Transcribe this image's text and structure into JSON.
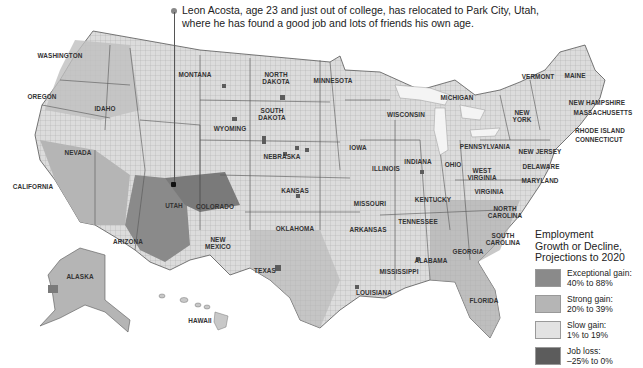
{
  "caption": {
    "line1": "Leon Acosta, age 23 and just out of college, has relocated to Park City, Utah,",
    "line2": "where he has found a good job and lots of friends his own age."
  },
  "map": {
    "title": "Employment Growth or Decline, Projections to 2020",
    "colors": {
      "exceptional": "#8a8a8a",
      "strong": "#b5b5b5",
      "slow": "#e2e2e2",
      "loss": "#5c5c5c",
      "border": "#444444",
      "water": "#ffffff"
    },
    "state_labels": [
      {
        "name": "WASHINGTON",
        "x": 60,
        "y": 55
      },
      {
        "name": "OREGON",
        "x": 42,
        "y": 96
      },
      {
        "name": "IDAHO",
        "x": 105,
        "y": 108
      },
      {
        "name": "MONTANA",
        "x": 195,
        "y": 74
      },
      {
        "name": "WYOMING",
        "x": 230,
        "y": 128
      },
      {
        "name": "NEVADA",
        "x": 78,
        "y": 152
      },
      {
        "name": "CALIFORNIA",
        "x": 33,
        "y": 186
      },
      {
        "name": "UTAH",
        "x": 174,
        "y": 205
      },
      {
        "name": "COLORADO",
        "x": 215,
        "y": 206
      },
      {
        "name": "ARIZONA",
        "x": 128,
        "y": 241
      },
      {
        "name": "NEW MEXICO",
        "x": 218,
        "y": 243
      },
      {
        "name": "NORTH DAKOTA",
        "x": 276,
        "y": 78
      },
      {
        "name": "SOUTH DAKOTA",
        "x": 272,
        "y": 114
      },
      {
        "name": "NEBRASKA",
        "x": 282,
        "y": 156
      },
      {
        "name": "KANSAS",
        "x": 295,
        "y": 190
      },
      {
        "name": "OKLAHOMA",
        "x": 295,
        "y": 228
      },
      {
        "name": "TEXAS",
        "x": 265,
        "y": 270
      },
      {
        "name": "MINNESOTA",
        "x": 333,
        "y": 80
      },
      {
        "name": "IOWA",
        "x": 358,
        "y": 147
      },
      {
        "name": "MISSOURI",
        "x": 370,
        "y": 203
      },
      {
        "name": "ARKANSAS",
        "x": 368,
        "y": 229
      },
      {
        "name": "LOUISIANA",
        "x": 374,
        "y": 292
      },
      {
        "name": "WISCONSIN",
        "x": 406,
        "y": 114
      },
      {
        "name": "ILLINOIS",
        "x": 386,
        "y": 168
      },
      {
        "name": "MICHIGAN",
        "x": 457,
        "y": 97
      },
      {
        "name": "INDIANA",
        "x": 418,
        "y": 161
      },
      {
        "name": "OHIO",
        "x": 453,
        "y": 164
      },
      {
        "name": "KENTUCKY",
        "x": 433,
        "y": 199
      },
      {
        "name": "TENNESSEE",
        "x": 418,
        "y": 221
      },
      {
        "name": "MISSISSIPPI",
        "x": 399,
        "y": 271
      },
      {
        "name": "ALABAMA",
        "x": 431,
        "y": 260
      },
      {
        "name": "GEORGIA",
        "x": 468,
        "y": 251
      },
      {
        "name": "FLORIDA",
        "x": 484,
        "y": 300
      },
      {
        "name": "SOUTH CAROLINA",
        "x": 503,
        "y": 239
      },
      {
        "name": "NORTH CAROLINA",
        "x": 505,
        "y": 212
      },
      {
        "name": "VIRGINIA",
        "x": 489,
        "y": 191
      },
      {
        "name": "WEST VIRGINIA",
        "x": 482,
        "y": 174
      },
      {
        "name": "PENNSYLVANIA",
        "x": 485,
        "y": 146
      },
      {
        "name": "NEW YORK",
        "x": 522,
        "y": 116
      },
      {
        "name": "NEW JERSEY",
        "x": 540,
        "y": 151
      },
      {
        "name": "DELAWARE",
        "x": 541,
        "y": 166
      },
      {
        "name": "MARYLAND",
        "x": 540,
        "y": 180
      },
      {
        "name": "VERMONT",
        "x": 538,
        "y": 76
      },
      {
        "name": "MAINE",
        "x": 575,
        "y": 75
      },
      {
        "name": "NEW HAMPSHIRE",
        "x": 597,
        "y": 102
      },
      {
        "name": "MASSACHUSETTS",
        "x": 603,
        "y": 112
      },
      {
        "name": "RHODE ISLAND",
        "x": 600,
        "y": 130
      },
      {
        "name": "CONNECTICUT",
        "x": 599,
        "y": 139
      },
      {
        "name": "ALASKA",
        "x": 80,
        "y": 276
      },
      {
        "name": "HAWAII",
        "x": 200,
        "y": 320
      }
    ]
  },
  "legend": {
    "title_lines": [
      "Employment",
      "Growth or Decline,",
      "Projections to 2020"
    ],
    "items": [
      {
        "label": "Exceptional gain:",
        "range": "40% to 88%",
        "color": "#8a8a8a"
      },
      {
        "label": "Strong gain:",
        "range": "20% to 39%",
        "color": "#b5b5b5"
      },
      {
        "label": "Slow gain:",
        "range": "1% to 19%",
        "color": "#e2e2e2"
      },
      {
        "label": "Job loss:",
        "range": "–25% to 0%",
        "color": "#5c5c5c"
      }
    ]
  }
}
